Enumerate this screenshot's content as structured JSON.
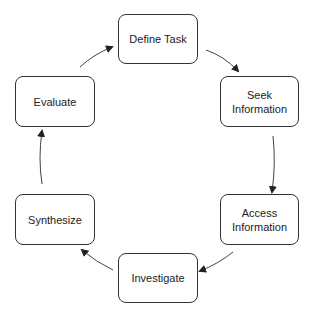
{
  "diagram": {
    "type": "cycle",
    "nodes": [
      {
        "id": "define",
        "label": "Define Task",
        "x": 118,
        "y": 14,
        "w": 80,
        "h": 50
      },
      {
        "id": "seek",
        "label": "Seek Information",
        "x": 220,
        "y": 76,
        "w": 79,
        "h": 51
      },
      {
        "id": "access",
        "label": "Access Information",
        "x": 220,
        "y": 194,
        "w": 79,
        "h": 51
      },
      {
        "id": "investigate",
        "label": "Investigate",
        "x": 118,
        "y": 253,
        "w": 80,
        "h": 50
      },
      {
        "id": "synthesize",
        "label": "Synthesize",
        "x": 15,
        "y": 194,
        "w": 80,
        "h": 51
      },
      {
        "id": "evaluate",
        "label": "Evaluate",
        "x": 15,
        "y": 76,
        "w": 80,
        "h": 51
      }
    ],
    "edges": [
      {
        "from": "define",
        "to": "seek"
      },
      {
        "from": "seek",
        "to": "access"
      },
      {
        "from": "access",
        "to": "investigate"
      },
      {
        "from": "investigate",
        "to": "synthesize"
      },
      {
        "from": "synthesize",
        "to": "evaluate"
      },
      {
        "from": "evaluate",
        "to": "define"
      }
    ],
    "colors": {
      "border": "#333333",
      "text": "#222222",
      "arrow": "#333333",
      "background": "#ffffff"
    }
  }
}
